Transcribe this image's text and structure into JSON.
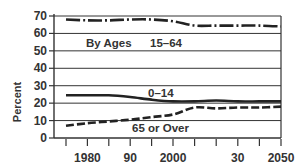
{
  "chart_data": {
    "type": "line",
    "title": "",
    "xlabel": "",
    "ylabel": "Percent",
    "ylim": [
      0,
      70
    ],
    "yticks": [
      0,
      10,
      20,
      30,
      40,
      50,
      60,
      70
    ],
    "xtick_labels": [
      {
        "label": "1980",
        "year": 1980
      },
      {
        "label": "90",
        "year": 1990
      },
      {
        "label": "2000",
        "year": 2000
      },
      {
        "label": "30",
        "year": 2030
      },
      {
        "label": "2050",
        "year": 2050
      }
    ],
    "grid": true,
    "legend": "inline annotations",
    "annotations": {
      "by_ages": "By Ages",
      "age_15_64": "15–64",
      "age_0_14": "0–14",
      "age_65_over": "65 or Over"
    },
    "x": [
      1975,
      1980,
      1985,
      1990,
      1995,
      2000,
      2010,
      2020,
      2030,
      2040,
      2050
    ],
    "series": [
      {
        "name": "15–64",
        "style": "dash-dot",
        "values": [
          68,
          67.5,
          67.5,
          68,
          68,
          67,
          64.5,
          64.5,
          64.5,
          64.5,
          64
        ]
      },
      {
        "name": "0–14",
        "style": "solid",
        "values": [
          24.5,
          24.5,
          24.5,
          23.5,
          22,
          21,
          21,
          21.5,
          21,
          21,
          21
        ]
      },
      {
        "name": "65 or Over",
        "style": "dashed",
        "values": [
          7,
          8.5,
          9.5,
          10.5,
          12,
          13.5,
          17.5,
          17,
          17.5,
          17.5,
          18
        ]
      }
    ]
  }
}
